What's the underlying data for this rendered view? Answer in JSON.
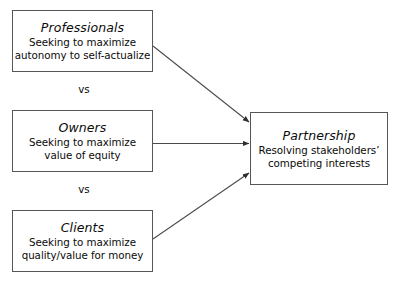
{
  "diagram": {
    "background_color": "#ffffff",
    "border_color": "#565656",
    "text_color": "#0a0a0a",
    "arrow_color": "#3a3a3a",
    "nodes": {
      "professionals": {
        "title": "Professionals",
        "description": "Seeking to maximize\nautonomy to self-actualize"
      },
      "owners": {
        "title": "Owners",
        "description": "Seeking to maximize\nvalue of equity"
      },
      "clients": {
        "title": "Clients",
        "description": "Seeking to maximize\nquality/value for money"
      },
      "partnership": {
        "title": "Partnership",
        "description": "Resolving stakeholders’\ncompeting interests"
      }
    },
    "separators": [
      {
        "label": "vs"
      },
      {
        "label": "vs"
      }
    ],
    "connectors": [
      {
        "from": "professionals",
        "to": "partnership",
        "style": "arrow"
      },
      {
        "from": "owners",
        "to": "partnership",
        "style": "arrow"
      },
      {
        "from": "clients",
        "to": "partnership",
        "style": "arrow"
      }
    ]
  }
}
